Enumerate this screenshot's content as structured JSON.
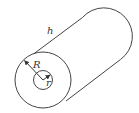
{
  "diagram": {
    "labels": {
      "length": "h",
      "outer_radius": "R",
      "inner_radius": "r"
    },
    "colors": {
      "stroke": "#444444",
      "text": "#333333",
      "background": "#ffffff"
    }
  }
}
